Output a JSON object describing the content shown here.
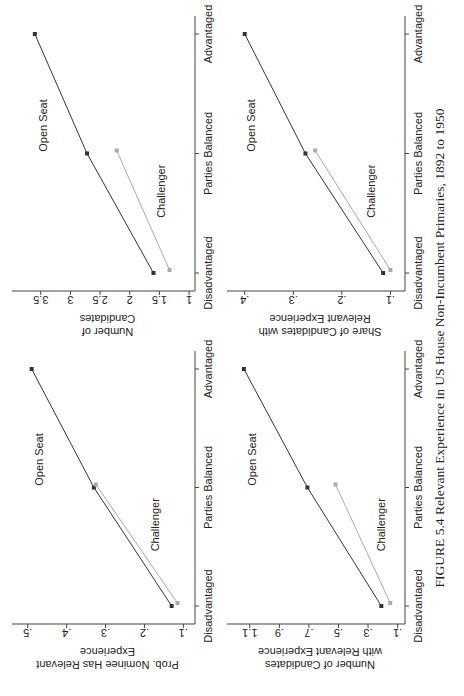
{
  "caption": "FIGURE 5.4 Relevant Experience in US House Non-Incumbent Primaries, 1892 to 1950",
  "colors": {
    "open_seat": "#333333",
    "challenger": "#aaaaaa",
    "axis": "#444444"
  },
  "chart_data": [
    {
      "type": "line",
      "position": "top-left",
      "ylabel": "Prob. Nominee Has Relevant Experience",
      "ylabel_lines": [
        "Prob. Nominee Has Relevant",
        "Experience"
      ],
      "categories": [
        "Disadvantaged",
        "Parties Balanced",
        "Advantaged"
      ],
      "yticks": [
        0.1,
        0.2,
        0.3,
        0.4,
        0.5
      ],
      "ytick_labels": [
        ".1",
        ".2",
        ".3",
        ".4",
        ".5"
      ],
      "ylim": [
        0.07,
        0.52
      ],
      "series": [
        {
          "name": "Open Seat",
          "values": [
            0.13,
            0.33,
            0.49
          ]
        },
        {
          "name": "Challenger",
          "values": [
            0.115,
            0.325,
            null
          ]
        }
      ]
    },
    {
      "type": "line",
      "position": "top-right",
      "ylabel": "Number of Candidates",
      "ylabel_lines": [
        "Number of",
        "Candidates"
      ],
      "categories": [
        "Disadvantaged",
        "Parties Balanced",
        "Advantaged"
      ],
      "yticks": [
        1,
        1.5,
        2,
        2.5,
        3,
        3.5
      ],
      "ytick_labels": [
        "1",
        "1.5",
        "2",
        "2.5",
        "3",
        "3.5"
      ],
      "ylim": [
        0.9,
        3.85
      ],
      "series": [
        {
          "name": "Open Seat",
          "values": [
            1.6,
            2.72,
            3.6
          ]
        },
        {
          "name": "Challenger",
          "values": [
            1.33,
            2.22,
            null
          ]
        }
      ]
    },
    {
      "type": "line",
      "position": "bottom-left",
      "ylabel": "Number of Candidates with Relevant Experience",
      "ylabel_lines": [
        "Number of Candidates",
        "with Relevant Experience"
      ],
      "categories": [
        "Disadvantaged",
        "Parties Balanced",
        "Advantaged"
      ],
      "yticks": [
        0.1,
        0.3,
        0.5,
        0.7,
        0.9,
        1.1
      ],
      "ytick_labels": [
        ".1",
        ".3",
        ".5",
        ".7",
        ".9",
        "1.1"
      ],
      "ylim": [
        0.05,
        1.2
      ],
      "series": [
        {
          "name": "Open Seat",
          "values": [
            0.21,
            0.71,
            1.14
          ]
        },
        {
          "name": "Challenger",
          "values": [
            0.15,
            0.52,
            null
          ]
        }
      ]
    },
    {
      "type": "line",
      "position": "bottom-right",
      "ylabel": "Share of Candidates with Relevant Experience",
      "ylabel_lines": [
        "Share of Candidates with",
        "Relevant Experience"
      ],
      "categories": [
        "Disadvantaged",
        "Parties Balanced",
        "Advantaged"
      ],
      "yticks": [
        0.1,
        0.2,
        0.3,
        0.4
      ],
      "ytick_labels": [
        ".1",
        ".2",
        ".3",
        ".4"
      ],
      "ylim": [
        0.07,
        0.42
      ],
      "series": [
        {
          "name": "Open Seat",
          "values": [
            0.115,
            0.275,
            0.4
          ]
        },
        {
          "name": "Challenger",
          "values": [
            0.1,
            0.255,
            null
          ]
        }
      ]
    }
  ]
}
